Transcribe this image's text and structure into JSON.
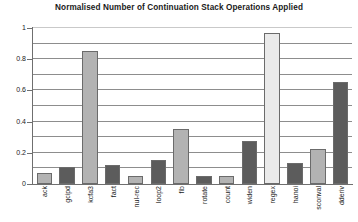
{
  "chart_data": {
    "type": "bar",
    "title": "Normalised Number of Continuation Stack Operations Applied",
    "xlabel": "",
    "ylabel": "",
    "ylim": [
      0,
      1
    ],
    "grid": true,
    "legend": "none",
    "y_ticks": [
      "0",
      "0.2",
      "0.4",
      "0.6",
      "0.8",
      "1"
    ],
    "y_tick_values": [
      0,
      0.2,
      0.4,
      0.6,
      0.8,
      1
    ],
    "gridline_interval": 0.1,
    "categories": [
      "ack",
      "gcipd",
      "kcfa3",
      "fact",
      "nul-rec",
      "loop2",
      "fib",
      "rotate",
      "count",
      "widen",
      "regex",
      "hanoi",
      "sconval",
      "dderiv"
    ],
    "values": [
      0.07,
      0.11,
      0.85,
      0.12,
      0.05,
      0.155,
      0.355,
      0.05,
      0.05,
      0.275,
      0.97,
      0.135,
      0.225,
      0.655
    ],
    "bar_shades": [
      "light",
      "dark",
      "light",
      "dark",
      "light",
      "dark",
      "light",
      "dark",
      "light",
      "dark",
      "pale",
      "dark",
      "light",
      "dark"
    ],
    "colors": {
      "bar_light": "#b3b3b3",
      "bar_dark": "#5c5c5c",
      "bar_pale": "#eaeaea",
      "bar_border": "#6b6b6b",
      "gridline": "#8d8d8d",
      "axis": "#6f6f6f",
      "text": "#1a1a1a",
      "background": "#ffffff"
    }
  }
}
